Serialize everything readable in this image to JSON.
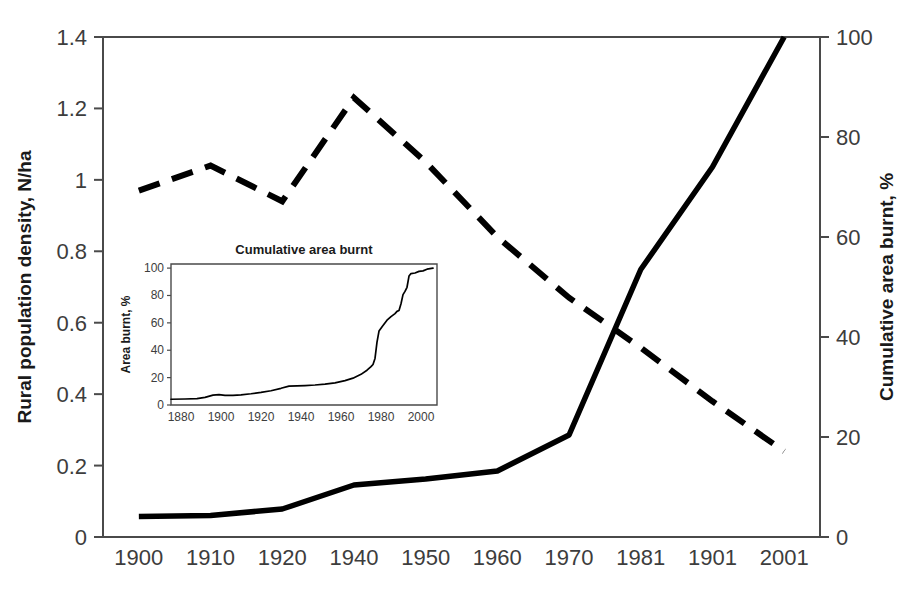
{
  "chart_data": {
    "type": "line",
    "title": "",
    "x": [
      "1900",
      "1910",
      "1920",
      "1940",
      "1950",
      "1960",
      "1970",
      "1981",
      "1901",
      "2001"
    ],
    "xlabel": "",
    "left_axis": {
      "label": "Rural population density, N/ha",
      "ticks": [
        "0",
        "0.2",
        "0.4",
        "0.6",
        "0.8",
        "1",
        "1.2",
        "1.4"
      ],
      "tick_values": [
        0,
        0.2,
        0.4,
        0.6,
        0.8,
        1,
        1.2,
        1.4
      ],
      "ylim": [
        0,
        1.4
      ]
    },
    "right_axis": {
      "label": "Cumulative area burnt, %",
      "ticks": [
        "0",
        "20",
        "40",
        "60",
        "80",
        "100"
      ],
      "tick_values": [
        0,
        20,
        40,
        60,
        80,
        100
      ],
      "ylim": [
        0,
        100
      ]
    },
    "grid": false,
    "legend": "none",
    "series": [
      {
        "name": "Cumulative area burnt",
        "style": "solid",
        "axis": "right",
        "units": "%",
        "x": [
          "1900",
          "1910",
          "1920",
          "1940",
          "1950",
          "1960",
          "1970",
          "1981",
          "1901",
          "2001"
        ],
        "values": [
          4.1,
          4.3,
          5.6,
          10.4,
          11.6,
          13.2,
          20.4,
          53.5,
          74.0,
          100.0
        ]
      },
      {
        "name": "Rural population density",
        "style": "dashed",
        "axis": "left",
        "units": "N/ha",
        "x": [
          "1900",
          "1910",
          "1920",
          "1940",
          "1950",
          "1960",
          "1970",
          "1981",
          "1901",
          "2001"
        ],
        "values": [
          0.97,
          1.04,
          0.94,
          1.23,
          1.05,
          0.84,
          0.67,
          0.53,
          0.38,
          0.24
        ]
      }
    ],
    "inset": {
      "type": "line",
      "title": "Cumulative area burnt",
      "xlabel": "",
      "ylabel": "Area burnt, %",
      "x_ticks": [
        "1880",
        "1900",
        "1920",
        "1940",
        "1960",
        "1980",
        "2000"
      ],
      "x_tick_values": [
        1880,
        1900,
        1920,
        1940,
        1960,
        1980,
        2000
      ],
      "y_ticks": [
        "0",
        "20",
        "40",
        "60",
        "80",
        "100"
      ],
      "y_tick_values": [
        0,
        20,
        40,
        60,
        80,
        100
      ],
      "xlim": [
        1875,
        2008
      ],
      "ylim": [
        0,
        103
      ],
      "grid": false,
      "series_name": "Cumulative area burnt",
      "points": [
        [
          1875,
          4.2
        ],
        [
          1882,
          4.4
        ],
        [
          1888,
          4.6
        ],
        [
          1892,
          5.6
        ],
        [
          1896,
          7.2
        ],
        [
          1899,
          7.6
        ],
        [
          1902,
          7.0
        ],
        [
          1906,
          7.0
        ],
        [
          1910,
          7.4
        ],
        [
          1915,
          8.2
        ],
        [
          1920,
          9.2
        ],
        [
          1925,
          10.4
        ],
        [
          1930,
          12.2
        ],
        [
          1934,
          13.8
        ],
        [
          1938,
          14.0
        ],
        [
          1942,
          14.2
        ],
        [
          1947,
          14.6
        ],
        [
          1952,
          15.2
        ],
        [
          1957,
          16.2
        ],
        [
          1962,
          17.8
        ],
        [
          1966,
          19.6
        ],
        [
          1970,
          22.4
        ],
        [
          1973,
          25.4
        ],
        [
          1975,
          28.0
        ],
        [
          1976,
          29.6
        ],
        [
          1977,
          34.0
        ],
        [
          1978,
          46.0
        ],
        [
          1979,
          54.0
        ],
        [
          1981,
          58.0
        ],
        [
          1983,
          62.0
        ],
        [
          1985,
          64.6
        ],
        [
          1987,
          66.8
        ],
        [
          1988,
          68.4
        ],
        [
          1989,
          69.0
        ],
        [
          1990,
          74.0
        ],
        [
          1991,
          80.6
        ],
        [
          1992,
          83.0
        ],
        [
          1993,
          86.0
        ],
        [
          1994,
          94.2
        ],
        [
          1995,
          96.0
        ],
        [
          1997,
          96.4
        ],
        [
          1999,
          97.6
        ],
        [
          2001,
          98.0
        ],
        [
          2003,
          99.2
        ],
        [
          2006,
          100.0
        ]
      ]
    }
  },
  "layout": {
    "plot_left": 103,
    "plot_right": 820,
    "plot_top": 37,
    "plot_bottom": 537,
    "inset_left": 171,
    "inset_right": 437,
    "inset_top": 264,
    "inset_bottom": 405
  }
}
